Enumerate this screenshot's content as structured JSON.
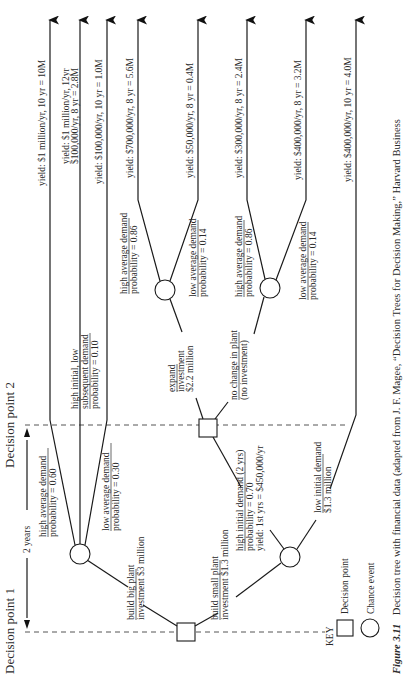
{
  "figure": {
    "caption_number": "Figure 3.11",
    "caption_text": "Decision tree with financial data (adapted from J. F. Magee, “Decision Trees for Decision Making,” Harvard Business"
  },
  "headers": {
    "decision_point_1": "Decision point 1",
    "decision_point_2": "Decision point 2",
    "interval": "2 years"
  },
  "branches": {
    "big_plant": [
      "build big plant",
      "investment $3 million"
    ],
    "small_plant": [
      "build small plant",
      "investment $1.3 million"
    ],
    "big_high": [
      "high average demand",
      "probability = 0.60"
    ],
    "big_mixed": [
      "high initial, low",
      "subsequent demand",
      "probability = 0.10"
    ],
    "big_low": [
      "low average demand",
      "probability = 0.30"
    ],
    "small_high_initial": [
      "high initial demand (2 yrs)",
      "probability = 0.70",
      "yield: 1st yrs = $450,000/yr"
    ],
    "small_low_initial": [
      "low initial demand",
      "$1.3 million"
    ],
    "expand": [
      "expand",
      "investment",
      "$2.2 million"
    ],
    "no_change": [
      "no change in plant",
      "(no investment)"
    ],
    "expand_high": [
      "high average demand",
      "probability = 0.86"
    ],
    "expand_low": [
      "low average demand",
      "probability = 0.14"
    ],
    "nochange_high": [
      "high average demand",
      "probability = 0.86"
    ],
    "nochange_low": [
      "low average demand",
      "probability = 0.14"
    ]
  },
  "outcomes": [
    [
      "yield: $1 million/yr, 10 yr = 10M"
    ],
    [
      "yield: $1 million/yr, 12yr",
      "$100,000/yr, 8 yr = 2.8M"
    ],
    [
      "yield: $100,000/yr, 10 yr = 1.0M"
    ],
    [
      "yield: $700,000/yr, 8 yr = 5.6M"
    ],
    [
      "yield: $50,000/yr, 8 yr = 0.4M"
    ],
    [
      "yield: $300,000/yr, 8 yr = 2.4M"
    ],
    [
      "yield: $400,000/yr, 8 yr = 3.2M"
    ],
    [
      "yield: $400,000/yr, 10 yr = 4.0M"
    ]
  ],
  "key": {
    "title": "KEY",
    "decision": "Decision point",
    "chance": "Chance event"
  }
}
